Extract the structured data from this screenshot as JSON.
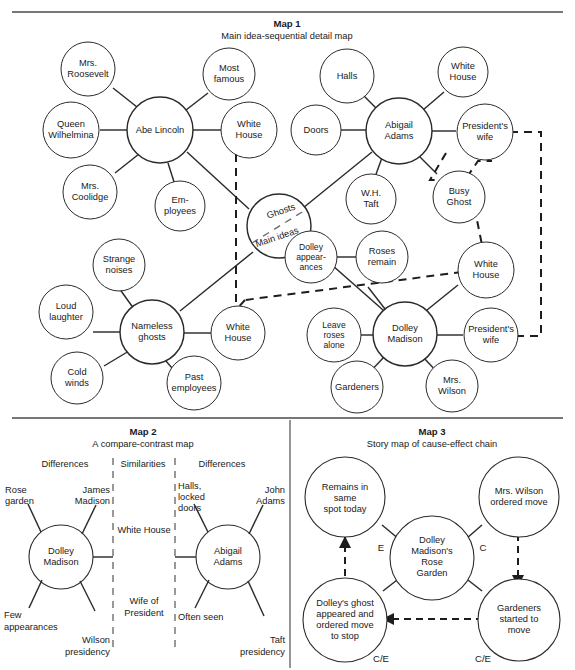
{
  "page": {
    "background": "#ffffff",
    "ink": "#1a1a1a"
  },
  "map1": {
    "title": "Map 1",
    "subtitle": "Main idea-sequential detail map",
    "center": {
      "top_label": "Ghosts",
      "bottom_label": "Main ideas"
    },
    "clusters": [
      {
        "name": "abe-lincoln",
        "hub": "Abe Lincoln",
        "leaves": [
          "Mrs. Roosevelt",
          "Most famous",
          "Queen Wilhelmina",
          "White House",
          "Mrs. Coolidge",
          "Em- ployees"
        ]
      },
      {
        "name": "abigail-adams",
        "hub": "Abigail Adams",
        "leaves": [
          "Halls",
          "White House",
          "Doors",
          "President's wife",
          "W.H. Taft",
          "Busy Ghost"
        ]
      },
      {
        "name": "nameless-ghosts",
        "hub": "Nameless ghosts",
        "leaves": [
          "Strange noises",
          "Loud laughter",
          "White House",
          "Cold winds",
          "Past employees"
        ]
      },
      {
        "name": "dolley-madison",
        "hub": "Dolley Madison",
        "leaves": [
          "Dolley appear- ances",
          "Roses remain",
          "White House",
          "Leave roses alone",
          "President's wife",
          "Gardeners",
          "Mrs. Wilson"
        ]
      }
    ],
    "nodes": {
      "mrs_roosevelt": "Mrs.\nRoosevelt",
      "most_famous": "Most\nfamous",
      "queen_wilhelmina": "Queen\nWilhelmina",
      "abe_lincoln": "Abe Lincoln",
      "white_house_1": "White\nHouse",
      "mrs_coolidge": "Mrs.\nCoolidge",
      "employees": "Em-\nployees",
      "halls": "Halls",
      "white_house_2": "White\nHouse",
      "doors": "Doors",
      "abigail_adams": "Abigail\nAdams",
      "presidents_wife_1": "President's\nwife",
      "wh_taft": "W.H.\nTaft",
      "busy_ghost": "Busy\nGhost",
      "strange_noises": "Strange\nnoises",
      "loud_laughter": "Loud\nlaughter",
      "nameless_ghosts": "Nameless\nghosts",
      "white_house_3": "White\nHouse",
      "cold_winds": "Cold\nwinds",
      "past_employees": "Past\nemployees",
      "dolley_appearances": "Dolley\nappear-\nances",
      "roses_remain": "Roses\nremain",
      "white_house_4": "White\nHouse",
      "leave_roses_alone": "Leave\nroses\nalone",
      "dolley_madison": "Dolley\nMadison",
      "presidents_wife_2": "President's\nwife",
      "gardeners": "Gardeners",
      "mrs_wilson": "Mrs.\nWilson"
    }
  },
  "map2": {
    "title": "Map 2",
    "subtitle": "A compare-contrast map",
    "columns": [
      "Differences",
      "Similarities",
      "Differences"
    ],
    "left_hub": "Dolley\nMadison",
    "right_hub": "Abigail\nAdams",
    "left_leaves": [
      "Rose\ngarden",
      "James\nMadison",
      "Few\nappearances",
      "Wilson\npresidency"
    ],
    "right_leaves": [
      "Halls,\nlocked\ndoors",
      "John\nAdams",
      "Often seen",
      "Taft\npresidency"
    ],
    "similarities": [
      "White House",
      "Wife of\nPresident"
    ]
  },
  "map3": {
    "title": "Map 3",
    "subtitle": "Story map of cause-effect chain",
    "hub": "Dolley\nMadison's\nRose\nGarden",
    "nodes": {
      "remains": "Remains in\nsame\nspot today",
      "ordered_move": "Mrs. Wilson\nordered move",
      "ghost": "Dolley's ghost\nappeared and\nordered move\nto stop",
      "gardeners": "Gardeners\nstarted to\nmove"
    },
    "labels": {
      "effect": "E",
      "cause": "C",
      "cause_effect_left": "C/E",
      "cause_effect_right": "C/E"
    }
  }
}
